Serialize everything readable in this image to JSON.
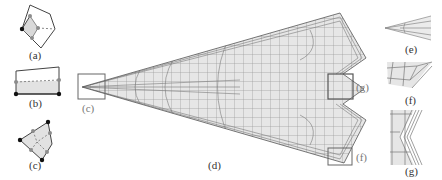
{
  "figure": {
    "panels": [
      {
        "id": "a",
        "label": "(a)",
        "description": "Pentagon element with shaded triangular corner region, dashed split line, corner vertex and edge midpoint nodes"
      },
      {
        "id": "b",
        "label": "(b)",
        "description": "Quadrilateral element with shaded lower strip below dashed line, corner and edge nodes"
      },
      {
        "id": "c",
        "label": "(c)",
        "description": "Quadrilateral element subdivided with dashed lines, shaded region, corner and edge nodes"
      },
      {
        "id": "d",
        "label": "(d)",
        "description": "Arrow/dart-shaped quad-dominant mesh with gray fill and boundary layer refinement"
      },
      {
        "id": "e",
        "label": "(e)",
        "description": "Zoomed detail of sharp tip at left of mesh"
      },
      {
        "id": "f",
        "label": "(f)",
        "description": "Zoomed detail of lower-right corner of mesh"
      },
      {
        "id": "g",
        "label": "(g)",
        "description": "Zoomed detail of concave notch at right of mesh"
      }
    ],
    "callouts": [
      {
        "target": "c",
        "label": "(c)"
      },
      {
        "target": "g",
        "label": "(g)"
      },
      {
        "target": "f",
        "label": "(f)"
      }
    ],
    "colors": {
      "mesh_fill": "#e6e6e6",
      "mesh_line": "#7a7a7a",
      "outline": "#444444",
      "node_black": "#111111",
      "node_gray": "#8c8c8c",
      "label": "#333333"
    }
  }
}
